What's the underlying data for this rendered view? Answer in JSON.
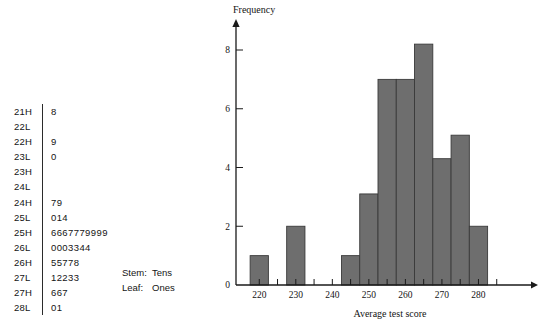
{
  "stem_leaf": {
    "rows": [
      {
        "stem": "21H",
        "leaf": "8"
      },
      {
        "stem": "22L",
        "leaf": ""
      },
      {
        "stem": "22H",
        "leaf": "9"
      },
      {
        "stem": "23L",
        "leaf": "0"
      },
      {
        "stem": "23H",
        "leaf": ""
      },
      {
        "stem": "24L",
        "leaf": ""
      },
      {
        "stem": "24H",
        "leaf": "79"
      },
      {
        "stem": "25L",
        "leaf": "014"
      },
      {
        "stem": "25H",
        "leaf": "6667779999"
      },
      {
        "stem": "26L",
        "leaf": "0003344"
      },
      {
        "stem": "26H",
        "leaf": "55778"
      },
      {
        "stem": "27L",
        "leaf": "12233"
      },
      {
        "stem": "27H",
        "leaf": "667"
      },
      {
        "stem": "28L",
        "leaf": "01"
      }
    ],
    "legend": [
      {
        "key": "Stem:",
        "value": "Tens"
      },
      {
        "key": "Leaf:",
        "value": "Ones"
      }
    ]
  },
  "chart_data": {
    "type": "bar",
    "title": "",
    "xlabel": "Average test score",
    "ylabel": "Frequency",
    "bar_width": 5,
    "bar_color": "#6e6e6e",
    "bar_edge_color": "#3a3a3a",
    "grid": false,
    "legend": "none",
    "xlim": [
      215,
      290
    ],
    "ylim": [
      0,
      8.8
    ],
    "x_ticks_major": [
      220,
      230,
      240,
      250,
      260,
      270,
      280
    ],
    "x_ticks_minor": [
      225,
      235,
      245,
      255,
      265,
      275,
      285
    ],
    "x_tick_labels": [
      "220",
      "230",
      "240",
      "250",
      "260",
      "270",
      "280"
    ],
    "y_ticks": [
      0,
      2,
      4,
      6,
      8
    ],
    "y_tick_labels": [
      "0",
      "2",
      "4",
      "6",
      "8"
    ],
    "categories": [
      220,
      230,
      245,
      250,
      255,
      260,
      265,
      270,
      275,
      280
    ],
    "values": [
      1,
      2,
      1,
      3.1,
      7,
      7,
      8.2,
      4.3,
      5.1,
      2
    ]
  }
}
